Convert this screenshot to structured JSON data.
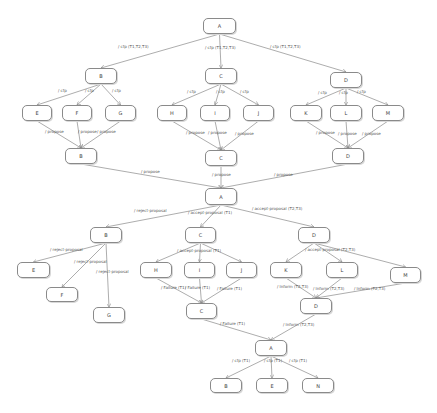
{
  "diagram": {
    "nodes": [
      {
        "id": "n_A1",
        "label": "A",
        "x": 203,
        "y": 18,
        "w": 33,
        "h": 16
      },
      {
        "id": "n_B1",
        "label": "B",
        "x": 85,
        "y": 68,
        "w": 32,
        "h": 16
      },
      {
        "id": "n_C1",
        "label": "C",
        "x": 205,
        "y": 68,
        "w": 32,
        "h": 16
      },
      {
        "id": "n_D1",
        "label": "D",
        "x": 330,
        "y": 72,
        "w": 32,
        "h": 16
      },
      {
        "id": "n_E1",
        "label": "E",
        "x": 22,
        "y": 105,
        "w": 30,
        "h": 16
      },
      {
        "id": "n_F1",
        "label": "F",
        "x": 62,
        "y": 105,
        "w": 30,
        "h": 16
      },
      {
        "id": "n_G1",
        "label": "G",
        "x": 105,
        "y": 105,
        "w": 31,
        "h": 16
      },
      {
        "id": "n_H1",
        "label": "H",
        "x": 157,
        "y": 105,
        "w": 30,
        "h": 16
      },
      {
        "id": "n_I1",
        "label": "I",
        "x": 200,
        "y": 105,
        "w": 30,
        "h": 16
      },
      {
        "id": "n_J1",
        "label": "J",
        "x": 243,
        "y": 105,
        "w": 31,
        "h": 16
      },
      {
        "id": "n_K1",
        "label": "K",
        "x": 290,
        "y": 105,
        "w": 32,
        "h": 16
      },
      {
        "id": "n_L1",
        "label": "L",
        "x": 330,
        "y": 105,
        "w": 32,
        "h": 16
      },
      {
        "id": "n_M1",
        "label": "M",
        "x": 372,
        "y": 105,
        "w": 32,
        "h": 16
      },
      {
        "id": "n_B2",
        "label": "B",
        "x": 65,
        "y": 148,
        "w": 32,
        "h": 16
      },
      {
        "id": "n_C2",
        "label": "C",
        "x": 205,
        "y": 150,
        "w": 32,
        "h": 16
      },
      {
        "id": "n_D2",
        "label": "D",
        "x": 332,
        "y": 148,
        "w": 32,
        "h": 16
      },
      {
        "id": "n_A2",
        "label": "A",
        "x": 205,
        "y": 188,
        "w": 32,
        "h": 17
      },
      {
        "id": "n_B3",
        "label": "B",
        "x": 90,
        "y": 227,
        "w": 32,
        "h": 16
      },
      {
        "id": "n_C3",
        "label": "C",
        "x": 185,
        "y": 227,
        "w": 31,
        "h": 16
      },
      {
        "id": "n_D3",
        "label": "D",
        "x": 298,
        "y": 227,
        "w": 32,
        "h": 16
      },
      {
        "id": "n_E2",
        "label": "E",
        "x": 17,
        "y": 262,
        "w": 33,
        "h": 16
      },
      {
        "id": "n_H2",
        "label": "H",
        "x": 140,
        "y": 262,
        "w": 32,
        "h": 16
      },
      {
        "id": "n_I2",
        "label": "I",
        "x": 184,
        "y": 262,
        "w": 31,
        "h": 16
      },
      {
        "id": "n_J2",
        "label": "J",
        "x": 226,
        "y": 262,
        "w": 31,
        "h": 16
      },
      {
        "id": "n_K2",
        "label": "K",
        "x": 270,
        "y": 262,
        "w": 32,
        "h": 16
      },
      {
        "id": "n_L2",
        "label": "L",
        "x": 326,
        "y": 262,
        "w": 32,
        "h": 16
      },
      {
        "id": "n_M2",
        "label": "M",
        "x": 390,
        "y": 267,
        "w": 31,
        "h": 16
      },
      {
        "id": "n_F2",
        "label": "F",
        "x": 46,
        "y": 287,
        "w": 32,
        "h": 15
      },
      {
        "id": "n_G2",
        "label": "G",
        "x": 93,
        "y": 307,
        "w": 32,
        "h": 16
      },
      {
        "id": "n_C4",
        "label": "C",
        "x": 186,
        "y": 303,
        "w": 31,
        "h": 16
      },
      {
        "id": "n_D4",
        "label": "D",
        "x": 300,
        "y": 298,
        "w": 32,
        "h": 16
      },
      {
        "id": "n_A3",
        "label": "A",
        "x": 255,
        "y": 340,
        "w": 32,
        "h": 16
      },
      {
        "id": "n_B4",
        "label": "B",
        "x": 210,
        "y": 378,
        "w": 32,
        "h": 15
      },
      {
        "id": "n_E3",
        "label": "E",
        "x": 256,
        "y": 378,
        "w": 32,
        "h": 15
      },
      {
        "id": "n_N1",
        "label": "N",
        "x": 302,
        "y": 378,
        "w": 32,
        "h": 15
      }
    ],
    "edges": [
      {
        "from": "n_A1",
        "to": "n_B1",
        "label": "/ cfp (T1,T2,T3)",
        "lx": 118,
        "ly": 44
      },
      {
        "from": "n_A1",
        "to": "n_C1",
        "label": "/ cfp (T1,T2,T3)",
        "lx": 205,
        "ly": 45
      },
      {
        "from": "n_A1",
        "to": "n_D1",
        "label": "/ cfp (T1,T2,T3)",
        "lx": 270,
        "ly": 44
      },
      {
        "from": "n_B1",
        "to": "n_E1",
        "label": "/ cfp",
        "lx": 58,
        "ly": 88
      },
      {
        "from": "n_B1",
        "to": "n_F1",
        "label": "/ cfp",
        "lx": 85,
        "ly": 88
      },
      {
        "from": "n_B1",
        "to": "n_G1",
        "label": "/ cfp",
        "lx": 112,
        "ly": 88
      },
      {
        "from": "n_C1",
        "to": "n_H1",
        "label": "/ cfp",
        "lx": 187,
        "ly": 89
      },
      {
        "from": "n_C1",
        "to": "n_I1",
        "label": "/ cfp",
        "lx": 216,
        "ly": 89
      },
      {
        "from": "n_C1",
        "to": "n_J1",
        "label": "/ cfp",
        "lx": 240,
        "ly": 89
      },
      {
        "from": "n_D1",
        "to": "n_K1",
        "label": "/ cfp",
        "lx": 318,
        "ly": 90
      },
      {
        "from": "n_D1",
        "to": "n_L1",
        "label": "/ cfp",
        "lx": 339,
        "ly": 90
      },
      {
        "from": "n_D1",
        "to": "n_M1",
        "label": "/ cfp",
        "lx": 357,
        "ly": 89
      },
      {
        "from": "n_E1",
        "to": "n_B2",
        "label": "/ propose",
        "lx": 45,
        "ly": 129
      },
      {
        "from": "n_F1",
        "to": "n_B2",
        "label": "/ propose",
        "lx": 78,
        "ly": 129
      },
      {
        "from": "n_G1",
        "to": "n_B2",
        "label": "/ propose",
        "lx": 97,
        "ly": 129
      },
      {
        "from": "n_H1",
        "to": "n_C2",
        "label": "/ propose",
        "lx": 186,
        "ly": 130
      },
      {
        "from": "n_I1",
        "to": "n_C2",
        "label": "/ propose",
        "lx": 208,
        "ly": 130
      },
      {
        "from": "n_J1",
        "to": "n_C2",
        "label": "/ propose",
        "lx": 235,
        "ly": 131
      },
      {
        "from": "n_K1",
        "to": "n_D2",
        "label": "/ propose",
        "lx": 316,
        "ly": 130
      },
      {
        "from": "n_L1",
        "to": "n_D2",
        "label": "/ propose",
        "lx": 338,
        "ly": 131
      },
      {
        "from": "n_M1",
        "to": "n_D2",
        "label": "/ propose",
        "lx": 362,
        "ly": 131
      },
      {
        "from": "n_B2",
        "to": "n_A2",
        "label": "/ propose",
        "lx": 141,
        "ly": 169
      },
      {
        "from": "n_C2",
        "to": "n_A2",
        "label": "/ propose",
        "lx": 212,
        "ly": 172
      },
      {
        "from": "n_D2",
        "to": "n_A2",
        "label": "/ propose",
        "lx": 274,
        "ly": 172
      },
      {
        "from": "n_A2",
        "to": "n_B3",
        "label": "/ reject-proposal",
        "lx": 134,
        "ly": 208
      },
      {
        "from": "n_A2",
        "to": "n_C3",
        "label": "/ accept-proposal (T1)",
        "lx": 188,
        "ly": 210
      },
      {
        "from": "n_A2",
        "to": "n_D3",
        "label": "/ accept-proposal (T2,T3)",
        "lx": 252,
        "ly": 206
      },
      {
        "from": "n_B3",
        "to": "n_E2",
        "label": "/ reject-proposal",
        "lx": 50,
        "ly": 247
      },
      {
        "from": "n_B3",
        "to": "n_F2",
        "label": "/ reject-proposal",
        "lx": 74,
        "ly": 259
      },
      {
        "from": "n_B3",
        "to": "n_G2",
        "label": "/ reject-proposal",
        "lx": 96,
        "ly": 269
      },
      {
        "from": "n_C3",
        "to": "n_H2",
        "label": "/ accept-proposal (T1)",
        "lx": 177,
        "ly": 248
      },
      {
        "from": "n_C3",
        "to": "n_I2",
        "label": "",
        "lx": 0,
        "ly": 0
      },
      {
        "from": "n_C3",
        "to": "n_J2",
        "label": "",
        "lx": 0,
        "ly": 0
      },
      {
        "from": "n_D3",
        "to": "n_K2",
        "label": "/ accept-proposal (T2,T3)",
        "lx": 305,
        "ly": 247
      },
      {
        "from": "n_D3",
        "to": "n_L2",
        "label": "",
        "lx": 0,
        "ly": 0
      },
      {
        "from": "n_D3",
        "to": "n_M2",
        "label": "",
        "lx": 0,
        "ly": 0
      },
      {
        "from": "n_H2",
        "to": "n_C4",
        "label": "/ Failure (T1)",
        "lx": 161,
        "ly": 285
      },
      {
        "from": "n_I2",
        "to": "n_C4",
        "label": "/ Failure (T1)",
        "lx": 185,
        "ly": 285
      },
      {
        "from": "n_J2",
        "to": "n_C4",
        "label": "/ Failure (T1)",
        "lx": 217,
        "ly": 286
      },
      {
        "from": "n_K2",
        "to": "n_D4",
        "label": "/ Inform (T2,T3)",
        "lx": 277,
        "ly": 284
      },
      {
        "from": "n_L2",
        "to": "n_D4",
        "label": "/ Inform (T2,T3)",
        "lx": 313,
        "ly": 286
      },
      {
        "from": "n_M2",
        "to": "n_D4",
        "label": "/ Inform (T2,T3)",
        "lx": 354,
        "ly": 286
      },
      {
        "from": "n_C4",
        "to": "n_A3",
        "label": "/ Failure (T1)",
        "lx": 220,
        "ly": 321
      },
      {
        "from": "n_D4",
        "to": "n_A3",
        "label": "/ Inform (T2,T3)",
        "lx": 283,
        "ly": 322
      },
      {
        "from": "n_A3",
        "to": "n_B4",
        "label": "/ cfp (T1)",
        "lx": 232,
        "ly": 358
      },
      {
        "from": "n_A3",
        "to": "n_E3",
        "label": "/ cfp (T1)",
        "lx": 264,
        "ly": 358
      },
      {
        "from": "n_A3",
        "to": "n_N1",
        "label": "/ cfp (T1)",
        "lx": 289,
        "ly": 358
      }
    ]
  },
  "colors": {
    "line": "#8a8a8a",
    "text": "#444444",
    "background": "#ffffff"
  }
}
